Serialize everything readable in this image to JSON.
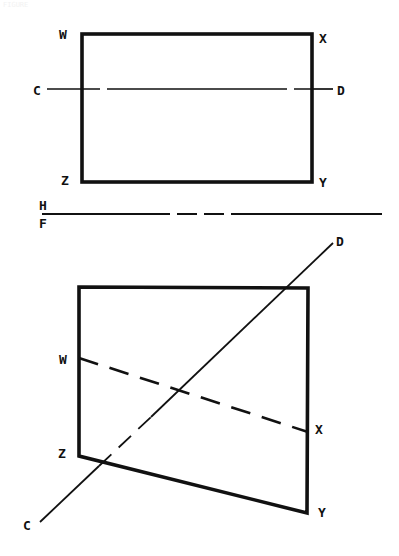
{
  "document": {
    "title": "Orthographic projection: plane WXYZ and line CD",
    "background_color": "#ffffff",
    "ink_color": "#111111",
    "width": 399,
    "height": 556,
    "faint_caption": "FIGURE"
  },
  "fold_line": {
    "upper_label": "H",
    "lower_label": "F",
    "name": "H/F reference line",
    "y": 214,
    "x_start": 42,
    "x_end": 382,
    "style": "phantom"
  },
  "top_view": {
    "name": "horizontal projection",
    "shape": "rectangle",
    "vertices": [
      {
        "label": "W",
        "x": 82,
        "y": 34,
        "label_x": 63,
        "label_y": 38
      },
      {
        "label": "X",
        "x": 312,
        "y": 34,
        "label_x": 322,
        "label_y": 42
      },
      {
        "label": "Y",
        "x": 312,
        "y": 182,
        "label_x": 322,
        "label_y": 186
      },
      {
        "label": "Z",
        "x": 82,
        "y": 182,
        "label_x": 64,
        "label_y": 184
      }
    ],
    "line_cd": {
      "start_label": "C",
      "end_label": "D",
      "start": {
        "x": 47,
        "y": 89
      },
      "end": {
        "x": 333,
        "y": 89
      },
      "start_label_x": 35,
      "start_label_y": 94,
      "end_label_x": 339,
      "end_label_y": 94,
      "visibility": "hidden inside plane",
      "style": "solid outside, dashed inside"
    }
  },
  "front_view": {
    "name": "frontal projection",
    "shape": "quadrilateral",
    "vertices": [
      {
        "label": "W",
        "x": 79,
        "y": 287,
        "label_x": 62,
        "label_y": 364
      },
      {
        "label": "X",
        "x": 308,
        "y": 288,
        "label_x": 317,
        "label_y": 433
      },
      {
        "label": "Y",
        "x": 307,
        "y": 513,
        "label_x": 320,
        "label_y": 516
      },
      {
        "label": "Z",
        "x": 79,
        "y": 456,
        "label_x": 61,
        "label_y": 457
      }
    ],
    "outline_points": [
      {
        "x": 79,
        "y": 287
      },
      {
        "x": 308,
        "y": 288
      },
      {
        "x": 307,
        "y": 513
      },
      {
        "x": 79,
        "y": 456
      }
    ],
    "line_wx": {
      "start_label": "W",
      "end_label": "X",
      "start": {
        "x": 79,
        "y": 358
      },
      "end": {
        "x": 308,
        "y": 432
      },
      "style": "dashed"
    },
    "line_cd": {
      "start_label": "C",
      "end_label": "D",
      "start": {
        "x": 40,
        "y": 522
      },
      "end": {
        "x": 333,
        "y": 243
      },
      "start_label_x": 25,
      "start_label_y": 529,
      "end_label_x": 338,
      "end_label_y": 244,
      "style": "solid with hidden segment inside plane"
    }
  },
  "labels": {
    "W": "W",
    "X": "X",
    "Y": "Y",
    "Z": "Z",
    "C": "C",
    "D": "D",
    "H": "H",
    "F": "F"
  }
}
